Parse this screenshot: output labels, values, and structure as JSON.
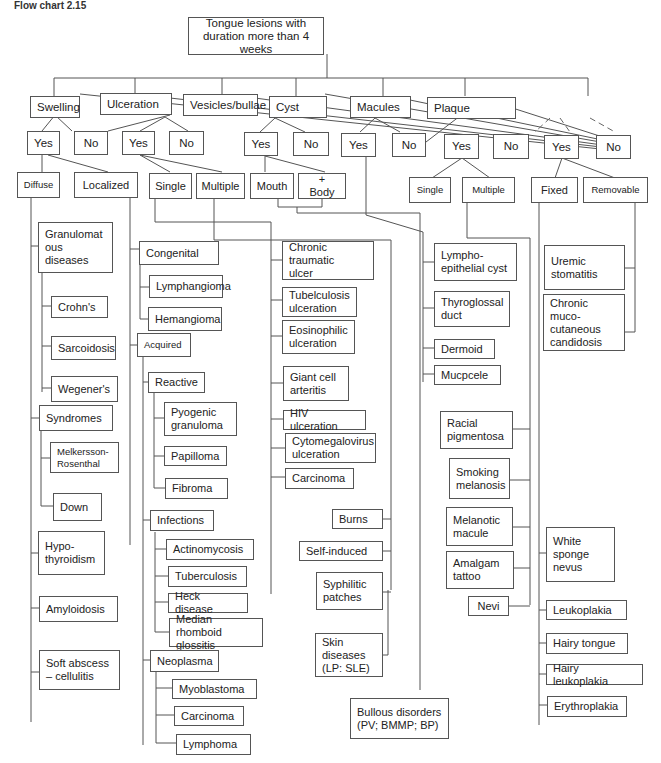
{
  "caption": "Flow chart 2.15",
  "root": "Tongue lesions with duration more than 4 weeks",
  "categories": {
    "swelling": {
      "label": "Swelling",
      "yes": "Yes",
      "no": "No",
      "diffuse": {
        "label": "Diffuse",
        "items": [
          "Granulomat\nous\ndiseases",
          "Crohn's",
          "Sarcoidosis",
          "Wegener's",
          "Syndromes",
          "Melkersson-\nRosenthal",
          "Down",
          "Hypo-\nthyroidism",
          "Amyloidosis",
          "Soft abscess\n– cellulitis"
        ]
      },
      "localized": {
        "label": "Localized",
        "items": [
          "Congenital",
          "Lymphangioma",
          "Hemangioma",
          "Acquired",
          "Reactive",
          "Pyogenic\ngranuloma",
          "Papilloma",
          "Fibroma",
          "Infections",
          "Actinomycosis",
          "Tuberculosis",
          "Heck disease",
          "Median rhomboid\nglossitis",
          "Neoplasma",
          "Myoblastoma",
          "Carcinoma",
          "Lymphoma"
        ]
      }
    },
    "ulceration": {
      "label": "Ulceration",
      "yes": "Yes",
      "no": "No",
      "single": {
        "label": "Single",
        "items": [
          "Chronic traumatic\nulcer",
          "Tubelculosis\nulceration",
          "Eosinophilic\nulceration",
          "Giant cell\narteritis",
          "HIV ulceration",
          "Cytomegalovirus\nulceration",
          "Carcinoma"
        ]
      },
      "multiple": {
        "label": "Multiple",
        "items": [
          "Burns",
          "Self-induced",
          "Syphilitic\npatches",
          "Skin\ndiseases\n(LP: SLE)"
        ]
      }
    },
    "vesicles": {
      "label": "Vesicles/bullae",
      "yes": "Yes",
      "no": "No",
      "mouth": "Mouth",
      "body": "+ Body",
      "items": [
        "Bullous disorders\n(PV; BMMP; BP)"
      ]
    },
    "cyst": {
      "label": "Cyst",
      "yes": "Yes",
      "no": "No",
      "items": [
        "Lympho-\nepithelial cyst",
        "Thyroglossal\nduct",
        "Dermoid",
        "Mucpcele"
      ]
    },
    "macules": {
      "label": "Macules",
      "yes": "Yes",
      "no": "No",
      "single": "Single",
      "multiple": "Multiple",
      "items": [
        "Racial\npigmentosa",
        "Smoking\nmelanosis",
        "Melanotic\nmacule",
        "Amalgam\ntattoo",
        "Nevi"
      ]
    },
    "plaque": {
      "label": "Plaque",
      "yes": "Yes",
      "no": "No",
      "fixed": {
        "label": "Fixed",
        "items": [
          "White\nsponge\nnevus",
          "Leukoplakia",
          "Hairy tongue",
          "Hairy leukoplakia",
          "Erythroplakia"
        ]
      },
      "removable": {
        "label": "Removable",
        "items": [
          "Uremic\nstomatitis",
          "Chronic muco-\ncutaneous\ncandidosis"
        ]
      }
    }
  },
  "colors": {
    "line": "#555555",
    "box_border": "#555555",
    "background": "#ffffff",
    "text": "#222222"
  }
}
